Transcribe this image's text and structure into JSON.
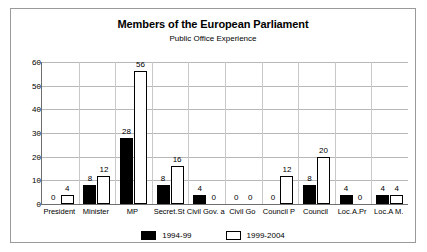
{
  "chart_data": {
    "type": "bar",
    "title": "Members of the European Parliament",
    "subtitle": "Public Office Experience",
    "xlabel": "",
    "ylabel": "",
    "ylim": [
      0,
      60
    ],
    "ytick_step": 10,
    "yticks": [
      0,
      10,
      20,
      30,
      40,
      50,
      60
    ],
    "grid": true,
    "legend_position": "bottom",
    "categories": [
      "President",
      "Minister",
      "MP",
      "Secret.St",
      "Civil Gov. a",
      "Civil Go",
      "Council P",
      "Council",
      "Loc.A.Pr",
      "Loc.A M."
    ],
    "series": [
      {
        "name": "1994-99",
        "color": "#000000",
        "values": [
          0,
          8,
          28,
          8,
          4,
          0,
          0,
          8,
          4,
          4
        ]
      },
      {
        "name": "1999-2004",
        "color": "#ffffff",
        "values": [
          4,
          12,
          56,
          16,
          0,
          0,
          12,
          20,
          0,
          4
        ]
      }
    ]
  }
}
